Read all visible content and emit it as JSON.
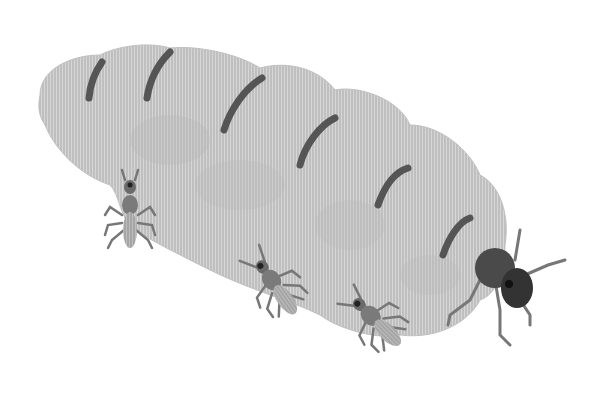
{
  "image": {
    "subject": "termite queen with worker termites",
    "style": "grayscale hatched illustration",
    "colors": {
      "background": "#ffffff",
      "abdomen": "#c9c9c9",
      "abdomen_shadow": "#b0b0b0",
      "stripe": "#555555",
      "queen_head": "#3a3a3a",
      "worker_body": "#7a7a7a",
      "worker_abdomen": "#b5b5b5",
      "legs": "#777777"
    }
  }
}
